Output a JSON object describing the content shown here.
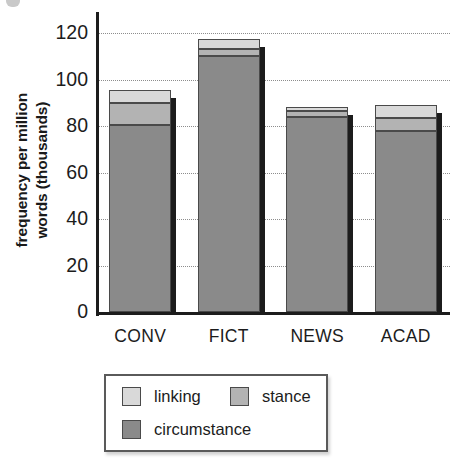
{
  "chart_data": {
    "type": "bar",
    "subtype": "stacked-bar",
    "title": "",
    "xlabel": "",
    "ylabel": "frequency per million\nwords (thousands)",
    "categories": [
      "CONV",
      "FICT",
      "NEWS",
      "ACAD"
    ],
    "series": [
      {
        "name": "circumstance",
        "values": [
          80.5,
          110.0,
          84.0,
          78.0
        ],
        "color": "#8a8a8a"
      },
      {
        "name": "stance",
        "values": [
          9.5,
          3.0,
          2.5,
          5.5
        ],
        "color": "#b3b3b3"
      },
      {
        "name": "linking",
        "values": [
          5.5,
          4.5,
          1.5,
          5.5
        ],
        "color": "#d9d9d9"
      }
    ],
    "totals": [
      95.5,
      117.5,
      88.0,
      89.0
    ],
    "ylim": [
      0,
      120
    ],
    "yticks": [
      0,
      20,
      40,
      60,
      80,
      100,
      120
    ],
    "ytick_labels": [
      "0",
      "20",
      "40",
      "60",
      "80",
      "100",
      "120"
    ],
    "grid": "horizontal-dotted",
    "legend_position": "below-left",
    "legend_entries": [
      "linking",
      "stance",
      "circumstance"
    ]
  },
  "axis": {
    "y_title_line1": "frequency per million",
    "y_title_line2": "words (thousands)"
  },
  "legend": {
    "items": [
      {
        "label": "linking",
        "color": "#d9d9d9"
      },
      {
        "label": "stance",
        "color": "#b3b3b3"
      },
      {
        "label": "circumstance",
        "color": "#8a8a8a"
      }
    ]
  }
}
